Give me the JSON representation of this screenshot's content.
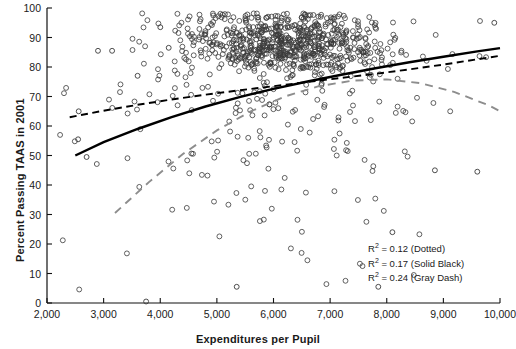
{
  "chart_data": {
    "type": "scatter",
    "title": "",
    "xlabel": "Expenditures per Pupil",
    "ylabel": "Percent Passing TAAS in 2001",
    "xlim": [
      2000,
      10000
    ],
    "ylim": [
      0,
      100
    ],
    "xticks": [
      2000,
      3000,
      4000,
      5000,
      6000,
      7000,
      8000,
      9000,
      10000
    ],
    "xticklabels": [
      "2,000",
      "3,000",
      "4,000",
      "5,000",
      "6,000",
      "7,000",
      "8,000",
      "9,000",
      "10,000"
    ],
    "yticks": [
      0,
      10,
      20,
      30,
      40,
      50,
      60,
      70,
      80,
      90,
      100
    ],
    "yticklabels": [
      "0",
      "10",
      "20",
      "30",
      "40",
      "50",
      "60",
      "70",
      "80",
      "90",
      "100"
    ],
    "grid": false,
    "marker": "open-circle",
    "marker_color": "#3a3a3a",
    "n_points": 900,
    "point_cluster": {
      "description": "dense cloud centered near 5,500-7,500 expenditures at 80-95 percent passing, long sparse tail downward",
      "x_mode": 6200,
      "y_mode": 88
    },
    "series": [
      {
        "name": "Dotted",
        "style": "dashed-black",
        "color": "#000000",
        "r2": 0.12,
        "x": [
          2400,
          3000,
          3600,
          4200,
          4800,
          5400,
          6000,
          6600,
          7200,
          7800,
          8400,
          9000,
          9600,
          10000
        ],
        "y": [
          63.0,
          65.2,
          67.2,
          69.0,
          70.6,
          72.1,
          73.5,
          74.9,
          76.3,
          77.7,
          79.2,
          80.8,
          82.6,
          83.8
        ]
      },
      {
        "name": "Solid Black",
        "style": "solid-black",
        "color": "#000000",
        "r2": 0.17,
        "x": [
          2500,
          3000,
          3600,
          4200,
          4800,
          5400,
          6000,
          6600,
          7200,
          7800,
          8400,
          9000,
          9600,
          10000
        ],
        "y": [
          50.0,
          54.5,
          59.0,
          63.0,
          66.6,
          69.8,
          72.6,
          75.1,
          77.4,
          79.6,
          81.6,
          83.5,
          85.3,
          86.4
        ]
      },
      {
        "name": "Gray Dash",
        "style": "dashed-gray",
        "color": "#8d8d8d",
        "r2": 0.24,
        "x": [
          3200,
          3800,
          4400,
          5000,
          5600,
          6200,
          6800,
          7400,
          8000,
          8600,
          9200,
          9800,
          10000
        ],
        "y": [
          30.5,
          41.0,
          50.5,
          58.5,
          65.0,
          70.0,
          73.5,
          75.4,
          75.8,
          74.5,
          71.5,
          67.0,
          65.0
        ]
      }
    ],
    "annotations": [
      "R² = 0.12 (Dotted)",
      "R² = 0.17 (Solid Black)",
      "R² = 0.24 (Gray Dash)"
    ]
  },
  "legend": {
    "position": "inside-bottom-right",
    "rows": [
      {
        "prefix": "R",
        "sup": "2",
        "text": " = 0.12 (Dotted)"
      },
      {
        "prefix": "R",
        "sup": "2",
        "text": " = 0.17 (Solid Black)"
      },
      {
        "prefix": "R",
        "sup": "2",
        "text": " = 0.24 (Gray Dash)"
      }
    ]
  }
}
